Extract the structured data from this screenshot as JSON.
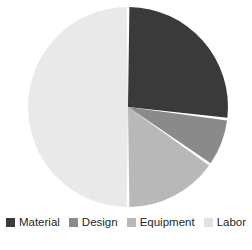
{
  "chart_data": {
    "type": "pie",
    "title": "",
    "legend_position": "bottom",
    "start_angle_deg": 0,
    "direction": "clockwise",
    "categories": [
      "Material",
      "Design",
      "Equipment",
      "Labor"
    ],
    "values": [
      27,
      8,
      15,
      50
    ],
    "unit": "percent",
    "colors": [
      "#3a3a3a",
      "#8a8a8a",
      "#b8b8b8",
      "#e9e9e9"
    ],
    "slice_gap_color": "#ffffff",
    "slices": [
      {
        "label": "Material",
        "value": 27,
        "color": "#3a3a3a",
        "start_deg": 0,
        "end_deg": 97
      },
      {
        "label": "Design",
        "value": 8,
        "color": "#8a8a8a",
        "start_deg": 97,
        "end_deg": 125
      },
      {
        "label": "Equipment",
        "value": 15,
        "color": "#b8b8b8",
        "start_deg": 125,
        "end_deg": 180
      },
      {
        "label": "Labor",
        "value": 50,
        "color": "#e9e9e9",
        "start_deg": 180,
        "end_deg": 360
      }
    ]
  },
  "legend": {
    "items": [
      {
        "label": "Material",
        "color": "#3a3a3a"
      },
      {
        "label": "Design",
        "color": "#8a8a8a"
      },
      {
        "label": "Equipment",
        "color": "#b8b8b8"
      },
      {
        "label": "Labor",
        "color": "#e2e2e2"
      }
    ]
  },
  "geometry": {
    "center_x": 128,
    "center_y": 107,
    "radius": 100
  }
}
